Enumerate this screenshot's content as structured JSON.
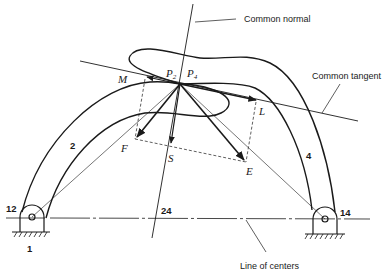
{
  "figure": {
    "labels": {
      "common_normal": "Common normal",
      "common_tangent": "Common tangent",
      "line_of_centers": "Line of centers",
      "contact_p": "P",
      "contact_p2_sub": "2",
      "contact_p4_sub": "4",
      "point_m": "M",
      "point_l": "L",
      "point_f": "F",
      "point_s": "S",
      "point_e": "E",
      "link_2": "2",
      "link_4": "4",
      "pivot_12": "12",
      "pivot_14": "14",
      "center_24": "24",
      "ground_1": "1"
    },
    "colors": {
      "ink": "#1a1a1a",
      "background": "#ffffff"
    }
  }
}
